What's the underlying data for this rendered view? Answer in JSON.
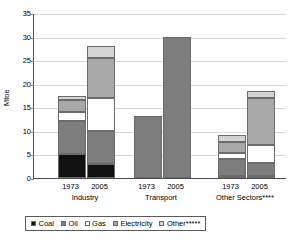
{
  "chart_data": {
    "type": "bar",
    "subtype": "stacked",
    "title": "",
    "xlabel": "",
    "ylabel": "Mtoe",
    "ylim": [
      0,
      35
    ],
    "ytick_step": 5,
    "yticks": [
      "35",
      "30",
      "25",
      "20",
      "15",
      "10",
      "5",
      "0"
    ],
    "grid": true,
    "legend_position": "bottom",
    "series": [
      {
        "name": "Coal",
        "color": "#111111",
        "values": [
          5.0,
          3.0,
          0.0,
          0.0,
          0.5,
          0.4
        ]
      },
      {
        "name": "Oil",
        "color": "#7d7d7d",
        "values": [
          7.0,
          7.0,
          13.2,
          30.0,
          3.6,
          2.8
        ]
      },
      {
        "name": "Gas",
        "color": "#ffffff",
        "values": [
          2.0,
          7.0,
          0.0,
          0.0,
          1.3,
          3.7
        ]
      },
      {
        "name": "Electricity",
        "color": "#a8a8a8",
        "values": [
          2.5,
          8.5,
          0.0,
          0.0,
          2.2,
          10.0
        ]
      },
      {
        "name": "Other*****",
        "color": "#d4d4d4",
        "values": [
          1.0,
          2.5,
          0.0,
          0.0,
          1.6,
          1.6
        ]
      }
    ],
    "groups": [
      {
        "label": "Industry",
        "years": [
          "1973",
          "2005"
        ],
        "totals": [
          17.5,
          28.0
        ]
      },
      {
        "label": "Transport",
        "years": [
          "1973",
          "2005"
        ],
        "totals": [
          13.2,
          30.0
        ]
      },
      {
        "label": "Other Sectors****",
        "years": [
          "1973",
          "2005"
        ],
        "totals": [
          9.2,
          18.5
        ]
      }
    ],
    "categories": [
      "Industry 1973",
      "Industry 2005",
      "Transport 1973",
      "Transport 2005",
      "Other Sectors 1973",
      "Other Sectors 2005"
    ]
  },
  "legend": {
    "items": [
      {
        "label": "Coal"
      },
      {
        "label": "Oil"
      },
      {
        "label": "Gas"
      },
      {
        "label": "Electricity"
      },
      {
        "label": "Other*****"
      }
    ]
  }
}
